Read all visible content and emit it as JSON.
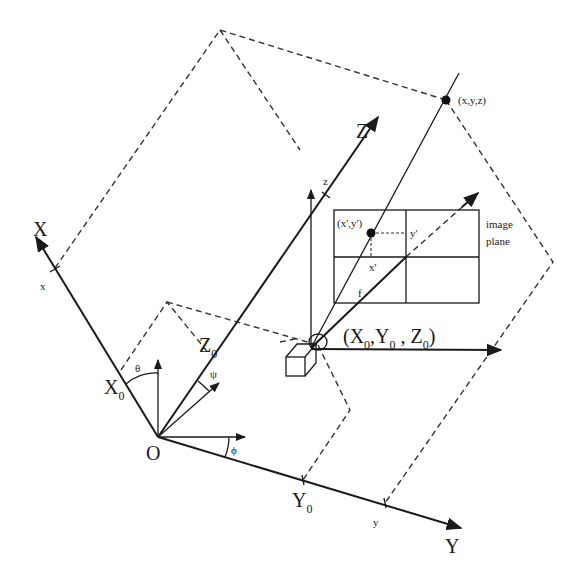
{
  "diagram": {
    "labels": {
      "axis_X": "X",
      "axis_Y": "Y",
      "axis_Z": "Z",
      "origin": "O",
      "tick_x": "x",
      "tick_y": "y",
      "tick_z": "z",
      "X0_main": "X",
      "X0_sub": "0",
      "Y0_main": "Y",
      "Y0_sub": "0",
      "Z0_main": "Z",
      "Z0_sub": "0",
      "theta": "θ",
      "psi": "ψ",
      "phi": "ϕ",
      "world_point": "(x,y,z)",
      "image_point": "(x',y')",
      "image_x": "x'",
      "image_y": "y'",
      "focal_length": "f",
      "image_plane_line1": "image",
      "image_plane_line2": "plane",
      "camera_pos_open": "(X",
      "camera_pos_s1": "0",
      "camera_pos_mid1": ",Y",
      "camera_pos_s2": "0",
      "camera_pos_mid2": " , Z",
      "camera_pos_s3": "0",
      "camera_pos_close": ")"
    },
    "colors": {
      "line": "#1a1a1a",
      "dashed": "#333333",
      "background": "#ffffff"
    }
  }
}
